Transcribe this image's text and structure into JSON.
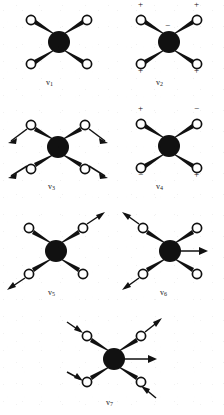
{
  "figure": {
    "type": "diagram",
    "atom_center_label": "central-atom",
    "atom_outer_label": "ligand-atom",
    "background_color": "#ffffff",
    "ink_color": "#111111"
  },
  "modes": [
    {
      "id": "v1",
      "label": "v",
      "subscript": "1",
      "col": 0,
      "row": 0,
      "geometry": "X-shaped, 4 ligands at diagonals",
      "arrows": [],
      "signs": []
    },
    {
      "id": "v2",
      "label": "v",
      "subscript": "2",
      "col": 1,
      "row": 0,
      "geometry": "X-shaped, 4 ligands at diagonals",
      "arrows": [],
      "signs": [
        {
          "text": "+",
          "at": "top-left"
        },
        {
          "text": "+",
          "at": "top-right"
        },
        {
          "text": "−",
          "at": "center"
        },
        {
          "text": "+",
          "at": "bottom-left"
        },
        {
          "text": "+",
          "at": "bottom-right"
        }
      ]
    },
    {
      "id": "v3",
      "label": "v",
      "subscript": "3",
      "col": 0,
      "row": 1,
      "geometry": "X-shaped, 4 ligands at diagonals",
      "arrows": [
        {
          "at": "top-left",
          "direction": "out-upper-left"
        },
        {
          "at": "top-right",
          "direction": "out-lower-right"
        },
        {
          "at": "bottom-left",
          "direction": "out-lower-left"
        },
        {
          "at": "bottom-right",
          "direction": "out-lower-right"
        }
      ],
      "signs": []
    },
    {
      "id": "v4",
      "label": "v",
      "subscript": "4",
      "col": 1,
      "row": 1,
      "geometry": "X-shaped, 4 ligands at diagonals",
      "arrows": [],
      "signs": [
        {
          "text": "+",
          "at": "top-left"
        },
        {
          "text": "−",
          "at": "top-right"
        },
        {
          "text": "−",
          "at": "bottom-left"
        },
        {
          "text": "+",
          "at": "bottom-right"
        }
      ]
    },
    {
      "id": "v5",
      "label": "v",
      "subscript": "5",
      "col": 0,
      "row": 2,
      "geometry": "X-shaped, 4 ligands at diagonals",
      "arrows": [
        {
          "at": "top-right",
          "direction": "out-upper-right"
        },
        {
          "at": "bottom-left",
          "direction": "out-lower-left"
        }
      ],
      "signs": []
    },
    {
      "id": "v6",
      "label": "v",
      "subscript": "6",
      "col": 1,
      "row": 2,
      "geometry": "X-shaped, 4 ligands at diagonals",
      "arrows": [
        {
          "at": "top-left",
          "direction": "out-upper-left"
        },
        {
          "at": "bottom-left",
          "direction": "out-lower-left"
        },
        {
          "at": "center",
          "direction": "right"
        }
      ],
      "signs": []
    },
    {
      "id": "v7",
      "label": "v",
      "subscript": "7",
      "col": "center",
      "row": 3,
      "geometry": "X-shaped, 4 ligands at diagonals",
      "arrows": [
        {
          "at": "top-left",
          "direction": "in-lower-right"
        },
        {
          "at": "top-right",
          "direction": "out-upper-right"
        },
        {
          "at": "bottom-left",
          "direction": "in-lower-left"
        },
        {
          "at": "bottom-right",
          "direction": "in-lower-right"
        },
        {
          "at": "center",
          "direction": "right"
        }
      ],
      "signs": []
    }
  ]
}
